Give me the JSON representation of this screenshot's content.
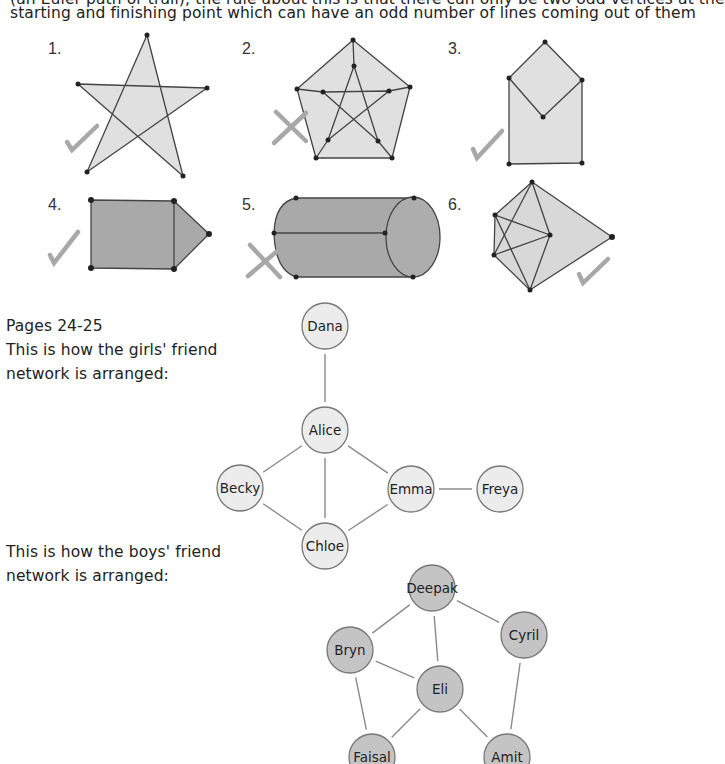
{
  "intro": {
    "line1": "(an Euler path or trail); the rule about this is that there can only be two odd vertices at the",
    "line2": "starting and finishing point which can have an odd number of lines coming out of them"
  },
  "puzzles": [
    {
      "number": "1.",
      "result": "tick"
    },
    {
      "number": "2.",
      "result": "cross"
    },
    {
      "number": "3.",
      "result": "tick"
    },
    {
      "number": "4.",
      "result": "tick"
    },
    {
      "number": "5.",
      "result": "cross"
    },
    {
      "number": "6.",
      "result": "tick"
    }
  ],
  "girls_section": {
    "pages": "Pages 24-25",
    "line1": "This is how the girls' friend",
    "line2": "network is arranged:",
    "nodes": [
      {
        "name": "Dana",
        "x": 325,
        "y": 326
      },
      {
        "name": "Alice",
        "x": 325,
        "y": 430
      },
      {
        "name": "Becky",
        "x": 240,
        "y": 488
      },
      {
        "name": "Emma",
        "x": 411,
        "y": 489
      },
      {
        "name": "Freya",
        "x": 500,
        "y": 489
      },
      {
        "name": "Chloe",
        "x": 325,
        "y": 546
      }
    ],
    "edges": [
      [
        "Dana",
        "Alice"
      ],
      [
        "Alice",
        "Becky"
      ],
      [
        "Alice",
        "Emma"
      ],
      [
        "Alice",
        "Chloe"
      ],
      [
        "Becky",
        "Chloe"
      ],
      [
        "Emma",
        "Chloe"
      ],
      [
        "Emma",
        "Freya"
      ]
    ],
    "node_fill": "#ececec"
  },
  "boys_section": {
    "line1": "This is how the boys' friend",
    "line2": "network is arranged:",
    "nodes": [
      {
        "name": "Deepak",
        "x": 432,
        "y": 588
      },
      {
        "name": "Cyril",
        "x": 524,
        "y": 635
      },
      {
        "name": "Bryn",
        "x": 350,
        "y": 650
      },
      {
        "name": "Eli",
        "x": 440,
        "y": 689
      },
      {
        "name": "Faisal",
        "x": 372,
        "y": 757
      },
      {
        "name": "Amit",
        "x": 507,
        "y": 757
      }
    ],
    "edges": [
      [
        "Deepak",
        "Bryn"
      ],
      [
        "Deepak",
        "Cyril"
      ],
      [
        "Deepak",
        "Eli"
      ],
      [
        "Bryn",
        "Eli"
      ],
      [
        "Bryn",
        "Faisal"
      ],
      [
        "Eli",
        "Faisal"
      ],
      [
        "Eli",
        "Amit"
      ],
      [
        "Cyril",
        "Amit"
      ]
    ],
    "node_fill": "#c4c4c4"
  },
  "colors": {
    "light_shape_fill": "#e0e0e0",
    "dark_shape_fill": "#a9a9a9",
    "mark_color": "#a8a8a8",
    "edge_color": "#8a8a8a"
  }
}
